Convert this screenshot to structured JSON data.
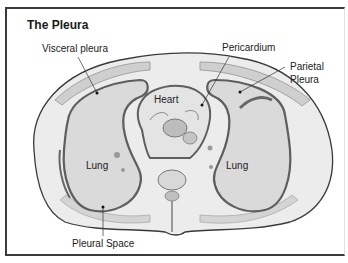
{
  "title": "The Pleura",
  "labels": {
    "visceral_pleura": "Visceral pleura",
    "pericardium": "Pericardium",
    "parietal_pleura_line1": "Parietal",
    "parietal_pleura_line2": "Pleura",
    "heart": "Heart",
    "lung_left": "Lung",
    "lung_right": "Lung",
    "pleural_space": "Pleural Space"
  },
  "colors": {
    "outline": "#3a3a3a",
    "tissue": "#e6e6e6",
    "lung_fill": "#dcdcdc",
    "pleura": "#6a6a6a",
    "muscle": "#c8c8c8"
  }
}
